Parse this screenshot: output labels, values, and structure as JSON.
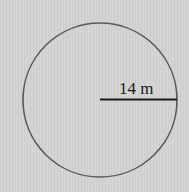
{
  "diagram": {
    "shape": "circle",
    "radius_label": "14 m",
    "colors": {
      "background": "#d2d2d2",
      "circle_stroke": "#5a5a5a",
      "radius_line": "#1a1a1a",
      "text": "#1a1a1a"
    }
  }
}
